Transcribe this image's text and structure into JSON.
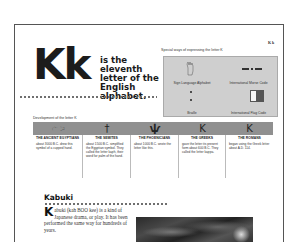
{
  "page": {
    "corner_label": "K k",
    "big_letter": "Kk",
    "intro": "is the eleventh letter of the English alphabet."
  },
  "special_ways": {
    "title": "Special ways of expressing the letter K",
    "items": [
      {
        "label": "Sign Language Alphabet",
        "icon": "hand-sign-icon"
      },
      {
        "label": "International Morse Code",
        "icon": "morse-code-icon",
        "value": "— • —"
      },
      {
        "label": "Braille",
        "icon": "braille-icon"
      },
      {
        "label": "International Flag Code",
        "icon": "flag-icon"
      }
    ]
  },
  "development": {
    "title": "Development of the letter K",
    "columns": [
      {
        "glyph": "𓂧",
        "heading": "THE ANCIENT EGYPTIANS",
        "body": "about 3000 B.C. drew this symbol of a cupped hand."
      },
      {
        "glyph": "†",
        "heading": "THE SEMITES",
        "body": "about 1500 B.C. simplified the Egyptian symbol. They called the letter kaph, their word for palm of the hand."
      },
      {
        "glyph": "ѱ",
        "heading": "THE PHOENICIANS",
        "body": "about 1000 B.C. wrote the letter like this."
      },
      {
        "glyph": "K",
        "heading": "THE GREEKS",
        "body": "gave the letter its present form about 600 B.C. They called the letter kappa."
      },
      {
        "glyph": "K",
        "heading": "THE ROMANS",
        "body": "began using the Greek letter about A.D. 114."
      }
    ]
  },
  "kabuki": {
    "title": "Kabuki",
    "drop_cap": "K",
    "body": "abuki (kah BOO kee) is a kind of Japanese drama, or play. It has been performed the same way for hundreds of years."
  },
  "colors": {
    "band": "#909090",
    "special_box": "#cfcfcf",
    "frame": "#555555"
  }
}
